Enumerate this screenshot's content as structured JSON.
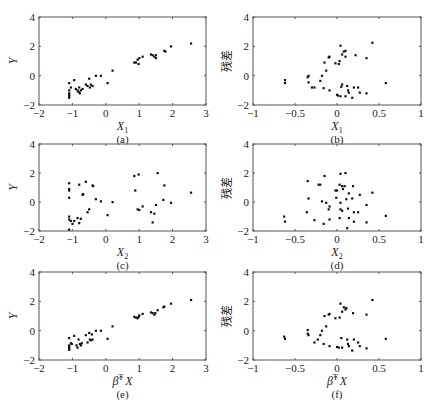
{
  "chart_data": [
    {
      "id": "a",
      "type": "scatter",
      "caption": "(a)",
      "xlabel": "X1",
      "xlabel_main": "X",
      "xlabel_sub": "1",
      "ylabel": "Y",
      "xlim": [
        -2,
        3
      ],
      "ylim": [
        -2,
        4
      ],
      "xticks": [
        "−2",
        "−1",
        "0",
        "1",
        "2",
        "3"
      ],
      "yticks": [
        "−2",
        "0",
        "2",
        "4"
      ],
      "points": [
        [
          -1.1,
          -0.5
        ],
        [
          -1.1,
          -1.0
        ],
        [
          -1.1,
          -1.2
        ],
        [
          -1.1,
          -1.3
        ],
        [
          -1.1,
          -1.4
        ],
        [
          -1.1,
          -1.5
        ],
        [
          -1.05,
          -0.8
        ],
        [
          -0.95,
          -0.3
        ],
        [
          -0.9,
          -0.9
        ],
        [
          -0.85,
          -1.0
        ],
        [
          -0.82,
          -1.1
        ],
        [
          -0.8,
          -0.8
        ],
        [
          -0.78,
          -1.2
        ],
        [
          -0.75,
          -1.0
        ],
        [
          -0.7,
          -0.9
        ],
        [
          -0.6,
          -0.6
        ],
        [
          -0.55,
          -0.7
        ],
        [
          -0.5,
          -0.2
        ],
        [
          -0.48,
          -0.8
        ],
        [
          -0.45,
          -0.6
        ],
        [
          -0.4,
          -0.7
        ],
        [
          -0.3,
          0.0
        ],
        [
          -0.15,
          0.0
        ],
        [
          0.05,
          -0.5
        ],
        [
          0.2,
          0.35
        ],
        [
          0.85,
          0.9
        ],
        [
          0.9,
          0.9
        ],
        [
          0.95,
          1.1
        ],
        [
          0.98,
          0.8
        ],
        [
          1.0,
          1.2
        ],
        [
          1.1,
          1.3
        ],
        [
          1.35,
          1.45
        ],
        [
          1.4,
          1.4
        ],
        [
          1.45,
          1.3
        ],
        [
          1.5,
          1.4
        ],
        [
          1.5,
          1.2
        ],
        [
          1.75,
          1.7
        ],
        [
          1.78,
          1.65
        ],
        [
          1.95,
          2.0
        ],
        [
          2.55,
          2.2
        ]
      ]
    },
    {
      "id": "b",
      "type": "scatter",
      "caption": "(b)",
      "xlabel": "X1",
      "xlabel_main": "X",
      "xlabel_sub": "1",
      "ylabel": "残差",
      "xlim": [
        -1,
        1
      ],
      "ylim": [
        -2,
        4
      ],
      "xticks": [
        "−1",
        "−0.5",
        "0",
        "0.5",
        "1"
      ],
      "yticks": [
        "−2",
        "0",
        "2",
        "4"
      ],
      "points": [
        [
          -0.62,
          -0.3
        ],
        [
          -0.62,
          -0.5
        ],
        [
          -0.35,
          -0.1
        ],
        [
          -0.34,
          0.0
        ],
        [
          -0.34,
          -0.45
        ],
        [
          -0.3,
          -0.8
        ],
        [
          -0.27,
          -0.8
        ],
        [
          -0.2,
          -0.35
        ],
        [
          -0.18,
          0.0
        ],
        [
          -0.16,
          -0.85
        ],
        [
          -0.15,
          0.9
        ],
        [
          -0.13,
          0.35
        ],
        [
          -0.1,
          1.25
        ],
        [
          -0.09,
          1.3
        ],
        [
          -0.09,
          -1.0
        ],
        [
          -0.02,
          0.85
        ],
        [
          0.0,
          -1.3
        ],
        [
          0.01,
          -1.35
        ],
        [
          0.02,
          0.8
        ],
        [
          0.03,
          1.0
        ],
        [
          0.04,
          2.05
        ],
        [
          0.04,
          -1.4
        ],
        [
          0.05,
          -0.75
        ],
        [
          0.06,
          1.45
        ],
        [
          0.06,
          -0.6
        ],
        [
          0.08,
          1.65
        ],
        [
          0.1,
          1.3
        ],
        [
          0.1,
          1.7
        ],
        [
          0.1,
          -1.4
        ],
        [
          0.12,
          -0.7
        ],
        [
          0.13,
          -1.0
        ],
        [
          0.14,
          -1.15
        ],
        [
          0.18,
          -1.5
        ],
        [
          0.2,
          -0.8
        ],
        [
          0.22,
          1.4
        ],
        [
          0.25,
          -0.8
        ],
        [
          0.27,
          -1.15
        ],
        [
          0.35,
          1.2
        ],
        [
          0.35,
          -1.2
        ],
        [
          0.42,
          2.25
        ],
        [
          0.58,
          -0.5
        ]
      ]
    },
    {
      "id": "c",
      "type": "scatter",
      "caption": "(c)",
      "xlabel": "X2",
      "xlabel_main": "X",
      "xlabel_sub": "2",
      "ylabel": "Y",
      "xlim": [
        -2,
        3
      ],
      "ylim": [
        -2,
        4
      ],
      "xticks": [
        "−2",
        "−1",
        "0",
        "1",
        "2",
        "3"
      ],
      "yticks": [
        "−2",
        "0",
        "2",
        "4"
      ],
      "points": [
        [
          -1.1,
          1.3
        ],
        [
          -1.1,
          0.9
        ],
        [
          -1.1,
          0.8
        ],
        [
          -1.1,
          0.3
        ],
        [
          -1.1,
          -1.0
        ],
        [
          -1.1,
          -1.2
        ],
        [
          -1.05,
          -1.3
        ],
        [
          -1.0,
          -1.5
        ],
        [
          -0.95,
          -1.3
        ],
        [
          -1.1,
          -1.9
        ],
        [
          -0.85,
          -1.1
        ],
        [
          -0.8,
          1.2
        ],
        [
          -0.8,
          -1.45
        ],
        [
          -0.75,
          -1.15
        ],
        [
          -0.7,
          0.5
        ],
        [
          -0.68,
          0.55
        ],
        [
          -0.6,
          1.4
        ],
        [
          -0.55,
          -0.7
        ],
        [
          -0.5,
          -0.5
        ],
        [
          -0.4,
          1.15
        ],
        [
          -0.38,
          1.1
        ],
        [
          -0.3,
          0.2
        ],
        [
          -0.15,
          0.05
        ],
        [
          0.05,
          -0.9
        ],
        [
          0.2,
          0.0
        ],
        [
          0.85,
          1.8
        ],
        [
          0.88,
          0.8
        ],
        [
          0.95,
          -0.5
        ],
        [
          0.98,
          1.9
        ],
        [
          1.0,
          -0.55
        ],
        [
          1.1,
          -0.3
        ],
        [
          1.35,
          -0.7
        ],
        [
          1.4,
          -1.4
        ],
        [
          1.45,
          -0.8
        ],
        [
          1.5,
          -0.2
        ],
        [
          1.55,
          2.0
        ],
        [
          1.72,
          0.15
        ],
        [
          1.75,
          1.15
        ],
        [
          1.95,
          -0.05
        ],
        [
          2.55,
          0.65
        ]
      ]
    },
    {
      "id": "d",
      "type": "scatter",
      "caption": "(d)",
      "xlabel": "X2",
      "xlabel_main": "X",
      "xlabel_sub": "2",
      "ylabel": "残差",
      "xlim": [
        -1,
        1
      ],
      "ylim": [
        -2,
        4
      ],
      "xticks": [
        "−1",
        "−0.5",
        "0",
        "0.5",
        "1"
      ],
      "yticks": [
        "−2",
        "0",
        "2",
        "4"
      ],
      "points": [
        [
          -0.63,
          -1.0
        ],
        [
          -0.62,
          -1.35
        ],
        [
          -0.36,
          -0.7
        ],
        [
          -0.35,
          1.45
        ],
        [
          -0.34,
          0.25
        ],
        [
          -0.27,
          -1.25
        ],
        [
          -0.22,
          1.2
        ],
        [
          -0.2,
          1.2
        ],
        [
          -0.18,
          0.05
        ],
        [
          -0.16,
          -1.5
        ],
        [
          -0.15,
          1.8
        ],
        [
          -0.13,
          -0.05
        ],
        [
          -0.1,
          -0.5
        ],
        [
          -0.09,
          -0.3
        ],
        [
          -0.09,
          -1.2
        ],
        [
          -0.02,
          0.8
        ],
        [
          -0.01,
          0.3
        ],
        [
          0.0,
          0.8
        ],
        [
          0.03,
          -1.1
        ],
        [
          0.03,
          1.2
        ],
        [
          0.04,
          1.95
        ],
        [
          0.04,
          -0.5
        ],
        [
          0.04,
          -0.05
        ],
        [
          0.06,
          1.1
        ],
        [
          0.06,
          -0.6
        ],
        [
          0.07,
          0.9
        ],
        [
          0.09,
          1.1
        ],
        [
          0.1,
          2.0
        ],
        [
          0.11,
          0.2
        ],
        [
          0.12,
          -1.8
        ],
        [
          0.13,
          -0.45
        ],
        [
          0.14,
          0.6
        ],
        [
          0.14,
          -1.1
        ],
        [
          0.18,
          0.25
        ],
        [
          0.19,
          1.1
        ],
        [
          0.2,
          -0.7
        ],
        [
          0.2,
          -1.35
        ],
        [
          0.25,
          -0.7
        ],
        [
          0.27,
          0.5
        ],
        [
          0.35,
          -0.2
        ],
        [
          0.35,
          -1.4
        ],
        [
          0.42,
          0.65
        ],
        [
          0.58,
          -0.95
        ]
      ]
    },
    {
      "id": "e",
      "type": "scatter",
      "caption": "(e)",
      "xlabel": "β̂ᵀX",
      "xlabel_main": "β̂",
      "xlabel_sup": "T",
      "xlabel_tail": "X",
      "ylabel": "Y",
      "xlim": [
        -2,
        3
      ],
      "ylim": [
        -2,
        4
      ],
      "xticks": [
        "−2",
        "−1",
        "0",
        "1",
        "2",
        "3"
      ],
      "yticks": [
        "−2",
        "0",
        "2",
        "4"
      ],
      "points": [
        [
          -1.1,
          -0.5
        ],
        [
          -1.1,
          -1.0
        ],
        [
          -1.1,
          -1.1
        ],
        [
          -1.1,
          -1.2
        ],
        [
          -1.1,
          -1.3
        ],
        [
          -1.05,
          -0.85
        ],
        [
          -1.02,
          -0.9
        ],
        [
          -0.95,
          -0.35
        ],
        [
          -0.88,
          -1.0
        ],
        [
          -0.85,
          -1.15
        ],
        [
          -0.82,
          -0.6
        ],
        [
          -0.78,
          -0.9
        ],
        [
          -0.75,
          -1.0
        ],
        [
          -0.72,
          -0.85
        ],
        [
          -0.6,
          -0.3
        ],
        [
          -0.55,
          -0.8
        ],
        [
          -0.5,
          -0.15
        ],
        [
          -0.48,
          -0.6
        ],
        [
          -0.45,
          -0.65
        ],
        [
          -0.42,
          -0.25
        ],
        [
          -0.4,
          -0.6
        ],
        [
          -0.3,
          0.0
        ],
        [
          -0.15,
          0.0
        ],
        [
          0.05,
          -0.55
        ],
        [
          0.2,
          0.3
        ],
        [
          0.85,
          0.95
        ],
        [
          0.9,
          0.9
        ],
        [
          0.95,
          0.85
        ],
        [
          0.98,
          0.95
        ],
        [
          1.0,
          1.05
        ],
        [
          1.1,
          1.15
        ],
        [
          1.35,
          1.25
        ],
        [
          1.4,
          1.2
        ],
        [
          1.45,
          1.1
        ],
        [
          1.48,
          1.2
        ],
        [
          1.55,
          1.4
        ],
        [
          1.72,
          1.6
        ],
        [
          1.75,
          1.65
        ],
        [
          1.95,
          1.85
        ],
        [
          2.55,
          2.1
        ]
      ]
    },
    {
      "id": "f",
      "type": "scatter",
      "caption": "(f)",
      "xlabel": "β̂ᵀX",
      "xlabel_main": "β̂",
      "xlabel_sup": "T",
      "xlabel_tail": "X",
      "ylabel": "残差",
      "xlim": [
        -1,
        1
      ],
      "ylim": [
        -2,
        4
      ],
      "xticks": [
        "−1",
        "−0.5",
        "0",
        "0.5",
        "1"
      ],
      "yticks": [
        "−2",
        "0",
        "2",
        "4"
      ],
      "points": [
        [
          -0.63,
          -0.4
        ],
        [
          -0.62,
          -0.55
        ],
        [
          -0.35,
          0.05
        ],
        [
          -0.35,
          -0.2
        ],
        [
          -0.34,
          -0.3
        ],
        [
          -0.27,
          -0.8
        ],
        [
          -0.23,
          -0.6
        ],
        [
          -0.2,
          -0.3
        ],
        [
          -0.18,
          0.0
        ],
        [
          -0.16,
          -0.9
        ],
        [
          -0.15,
          1.0
        ],
        [
          -0.13,
          0.3
        ],
        [
          -0.1,
          1.1
        ],
        [
          -0.09,
          1.15
        ],
        [
          -0.09,
          -1.05
        ],
        [
          -0.02,
          0.85
        ],
        [
          0.0,
          -1.1
        ],
        [
          0.02,
          -1.15
        ],
        [
          0.03,
          0.9
        ],
        [
          0.04,
          1.85
        ],
        [
          0.05,
          -0.5
        ],
        [
          0.06,
          1.3
        ],
        [
          0.06,
          -1.15
        ],
        [
          0.08,
          1.6
        ],
        [
          0.1,
          1.45
        ],
        [
          0.11,
          1.55
        ],
        [
          0.12,
          -0.6
        ],
        [
          0.13,
          -0.9
        ],
        [
          0.14,
          -1.05
        ],
        [
          0.18,
          -1.35
        ],
        [
          0.19,
          1.2
        ],
        [
          0.2,
          -0.6
        ],
        [
          0.25,
          -0.8
        ],
        [
          0.27,
          -1.05
        ],
        [
          0.35,
          1.1
        ],
        [
          0.35,
          -1.2
        ],
        [
          0.42,
          2.1
        ],
        [
          0.58,
          -0.55
        ]
      ]
    }
  ],
  "layout": {
    "panels": [
      {
        "id": "a",
        "x0": 39,
        "x1": 206,
        "y0": 17,
        "y1": 105
      },
      {
        "id": "b",
        "x0": 253,
        "x1": 421,
        "y0": 17,
        "y1": 105
      },
      {
        "id": "c",
        "x0": 39,
        "x1": 206,
        "y0": 144,
        "y1": 231
      },
      {
        "id": "d",
        "x0": 253,
        "x1": 421,
        "y0": 144,
        "y1": 231
      },
      {
        "id": "e",
        "x0": 39,
        "x1": 206,
        "y0": 272,
        "y1": 360
      },
      {
        "id": "f",
        "x0": 253,
        "x1": 421,
        "y0": 272,
        "y1": 360
      }
    ],
    "axis_color": "#555555",
    "point_color": "#111111"
  }
}
